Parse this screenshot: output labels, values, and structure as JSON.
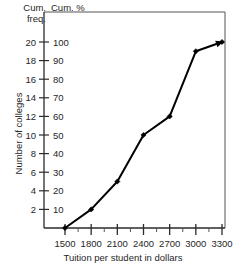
{
  "chart_data": {
    "type": "line",
    "title": "",
    "subtitle": "",
    "xlabel": "Tuition per student in dollars",
    "ylabel": "Number of colleges",
    "x": [
      1500,
      1800,
      2100,
      2400,
      2700,
      3000,
      3300
    ],
    "values": [
      0,
      2,
      5,
      10,
      12,
      19,
      20
    ],
    "series": [
      {
        "name": "Cumulative frequency",
        "values": [
          0,
          2,
          5,
          10,
          12,
          19,
          20
        ]
      },
      {
        "name": "Cumulative percent",
        "values": [
          0,
          10,
          25,
          50,
          60,
          95,
          100
        ]
      }
    ],
    "xlim": [
      1500,
      3300
    ],
    "ylim": [
      0,
      20
    ],
    "y2lim": [
      0,
      100
    ],
    "xticks": [
      1500,
      1800,
      2100,
      2400,
      2700,
      3000,
      3300
    ],
    "xtick_labels": [
      "1500",
      "1800",
      "2100",
      "2400",
      "2700",
      "3000",
      "3300"
    ],
    "xminor_ticks": [
      1650,
      1950,
      2250,
      2550,
      2850,
      3150
    ],
    "yticks": [
      2,
      4,
      6,
      8,
      10,
      12,
      14,
      16,
      18,
      20
    ],
    "ytick_labels": [
      "2",
      "4",
      "6",
      "8",
      "10",
      "12",
      "14",
      "16",
      "18",
      "20"
    ],
    "y2ticks": [
      10,
      20,
      30,
      40,
      50,
      60,
      70,
      80,
      90,
      100
    ],
    "y2tick_labels": [
      "10",
      "20",
      "30",
      "40",
      "50",
      "60",
      "70",
      "80",
      "90",
      "100"
    ],
    "grid": false,
    "legend": "none",
    "marker": "filled-diamond",
    "line_end_arrow": true
  },
  "axes": {
    "left_header_line1": "Cum.",
    "left_header_line2": "freq.",
    "right_header": "Cum. %",
    "y_axis_title": "Number of colleges",
    "x_axis_title": "Tuition per student in dollars"
  }
}
